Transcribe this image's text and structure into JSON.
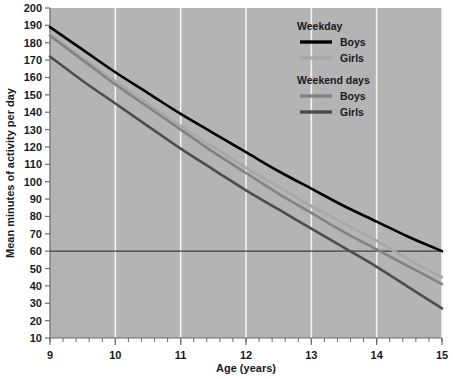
{
  "chart_data": {
    "type": "line",
    "title": "",
    "xlabel": "Age (years)",
    "ylabel": "Mean minutes of activity per day",
    "xlim": [
      9,
      15
    ],
    "ylim": [
      10,
      200
    ],
    "xticks": [
      9,
      10,
      11,
      12,
      13,
      14,
      15
    ],
    "xtick_labels": [
      "9",
      "10",
      "11",
      "12",
      "13",
      "14",
      "15"
    ],
    "yticks": [
      10,
      20,
      30,
      40,
      50,
      60,
      70,
      80,
      90,
      100,
      110,
      120,
      130,
      140,
      150,
      160,
      170,
      180,
      190,
      200
    ],
    "ytick_labels": [
      "10",
      "20",
      "30",
      "40",
      "50",
      "60",
      "70",
      "80",
      "90",
      "100",
      "110",
      "120",
      "130",
      "140",
      "150",
      "160",
      "170",
      "180",
      "190",
      "200"
    ],
    "grid": "vertical-white-gridlines-at-integer-ages",
    "plot_background": "#b4b4b4",
    "reference_lines": [
      {
        "name": "60-minutes-guideline",
        "orientation": "horizontal",
        "value": 60,
        "color": "#3f3f3f"
      }
    ],
    "x": [
      9,
      9.5,
      10,
      10.5,
      11,
      11.5,
      12,
      12.5,
      13,
      13.5,
      14,
      14.5,
      15
    ],
    "series": [
      {
        "name": "Weekday Boys",
        "group": "Weekday",
        "sex": "Boys",
        "color": "#000000",
        "values": [
          189,
          176,
          163,
          151,
          139,
          128,
          117,
          106,
          96,
          86,
          77,
          68,
          60
        ]
      },
      {
        "name": "Weekday Girls",
        "group": "Weekday",
        "sex": "Girls",
        "color": "#a8a8a8",
        "values": [
          185,
          171,
          158,
          145,
          132,
          120,
          108,
          97,
          86,
          76,
          66,
          55,
          45
        ]
      },
      {
        "name": "Weekend days Boys",
        "group": "Weekend days",
        "sex": "Boys",
        "color": "#838383",
        "values": [
          184,
          170,
          156,
          143,
          130,
          117,
          105,
          93,
          82,
          71,
          61,
          51,
          41
        ]
      },
      {
        "name": "Weekend days Girls",
        "group": "Weekend days",
        "sex": "Girls",
        "color": "#4d4d4d",
        "values": [
          172,
          158,
          145,
          132,
          119,
          107,
          95,
          84,
          73,
          62,
          51,
          39,
          27
        ]
      }
    ],
    "legend_position": "top-right-inside",
    "legend": {
      "groups": [
        {
          "heading": "Weekday",
          "entries": [
            {
              "label": "Boys",
              "color": "#000000"
            },
            {
              "label": "Girls",
              "color": "#a8a8a8"
            }
          ]
        },
        {
          "heading": "Weekend days",
          "entries": [
            {
              "label": "Boys",
              "color": "#838383"
            },
            {
              "label": "Girls",
              "color": "#4d4d4d"
            }
          ]
        }
      ]
    }
  }
}
